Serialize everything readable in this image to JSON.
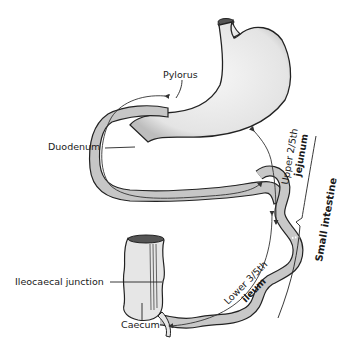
{
  "diagram": {
    "labels": {
      "pylorus": "Pylorus",
      "duodenum": "Duodenum",
      "ileocaecal_junction": "Ileocaecal junction",
      "caecum": "Caecum",
      "upper_fraction": "Upper 2/5th",
      "jejunum": "jejunum",
      "lower_fraction": "Lower 3/5th",
      "ileum": "ileum",
      "small_intestine": "Small intestine"
    },
    "colors": {
      "stomach_fill": "#ececec",
      "intestine_fill": "#c8c8c8",
      "outline": "#222222",
      "caecum_fill": "#e6e6e6"
    }
  }
}
